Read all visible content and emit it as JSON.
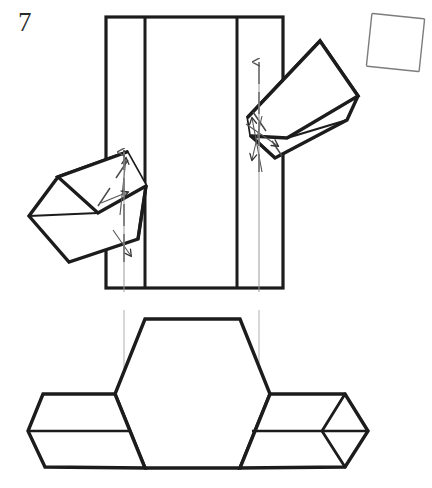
{
  "figure": {
    "label": "7",
    "domain": "folding-diagram",
    "canvas": {
      "width": 432,
      "height": 488,
      "background": "#ffffff"
    },
    "style": {
      "stroke_heavy": "#1c1c1c",
      "stroke_light": "#8a8a8a",
      "stroke_guide": "#9a9a9a",
      "stroke_dashed": "#3a3a3a",
      "fill": "none",
      "heavy_width": 3.2,
      "light_width": 1.0,
      "guide_width": 1.0
    },
    "parts": {
      "vertical_band": {
        "name": "vertical-band",
        "x_left": 106,
        "x_right": 283,
        "y_top": 17,
        "y_bottom": 288,
        "crease_x": [
          145,
          237
        ]
      },
      "upper_right_prism": {
        "name": "upper-right-tilted-prism",
        "outline": "251,136 248,117 320,41 358,96 347,120 275,158",
        "top_face": "251,136 320,41 358,96 287,138",
        "angle_deg": -46
      },
      "left_prism": {
        "name": "left-tilted-prism",
        "outline": "146,186 127,152 58,177 29,216 69,262 138,239",
        "top_face": "146,186 127,152 58,177 98,213",
        "angle_deg": 22
      },
      "loose_square": {
        "name": "loose-rotated-square",
        "cx": 396,
        "cy": 43,
        "size": 53,
        "rotation_deg": 6
      },
      "base_hexagon": {
        "name": "base-hexagon-body",
        "points": "145,319 240,319 270,394 240,468 145,468 115,394"
      },
      "left_flap": {
        "name": "left-side-flap",
        "outer": "115,394 43,394 28,431 45,467 145,468",
        "mid_line": "28,431 130,431"
      },
      "right_flap": {
        "name": "right-side-flap",
        "outer": "270,394 345,394 368,431 345,467 240,468",
        "mid_line": "252,431 368,431",
        "end_cap": "345,394 368,431 345,467 322,431"
      },
      "guides": [
        {
          "name": "guide-arrow-left",
          "x": 124,
          "y_from": 292,
          "y_to": 150
        },
        {
          "name": "guide-arrow-right",
          "x": 259,
          "y_from": 292,
          "y_to": 60
        }
      ],
      "fold_arrows": [
        {
          "name": "fold-arrow-left-up",
          "from": "117,212",
          "to": "127,155"
        },
        {
          "name": "fold-arrow-left-mid",
          "from": "103,200",
          "to": "130,190"
        },
        {
          "name": "fold-arrow-left-down",
          "from": "112,232",
          "to": "130,257"
        },
        {
          "name": "fold-arrow-right-up",
          "from": "260,160",
          "to": "250,115"
        },
        {
          "name": "fold-arrow-right-mid",
          "from": "245,125",
          "to": "275,144"
        },
        {
          "name": "fold-arrow-right-down",
          "from": "263,118",
          "to": "250,158"
        }
      ]
    }
  }
}
